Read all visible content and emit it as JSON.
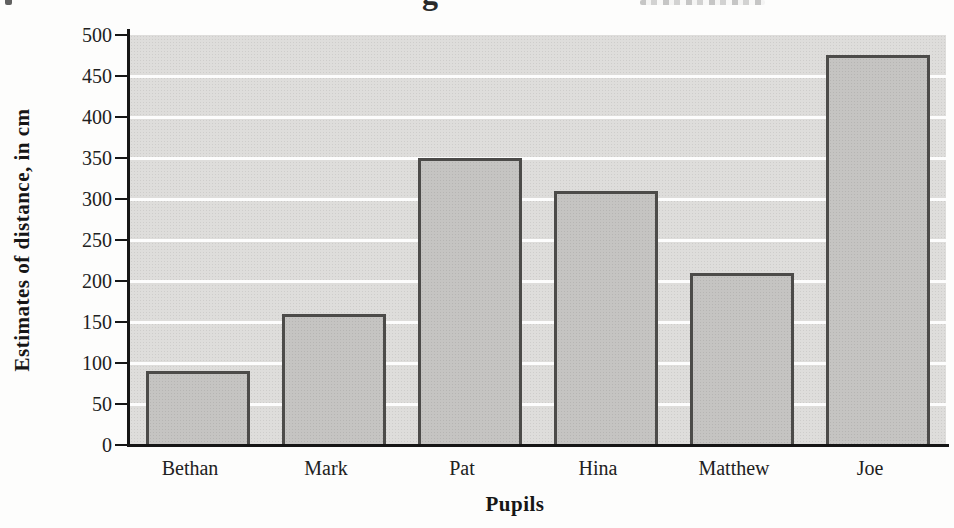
{
  "cropped_title": {
    "visible_descender": "g"
  },
  "chart_data": {
    "type": "bar",
    "title": "",
    "categories": [
      "Bethan",
      "Mark",
      "Pat",
      "Hina",
      "Matthew",
      "Joe"
    ],
    "values": [
      90,
      160,
      350,
      310,
      210,
      475
    ],
    "xlabel": "Pupils",
    "ylabel": "Estimates of distance, in cm",
    "ylim": [
      0,
      500
    ],
    "yticks": [
      0,
      50,
      100,
      150,
      200,
      250,
      300,
      350,
      400,
      450,
      500
    ],
    "grid": "horizontal white gridlines every 50",
    "legend": "none",
    "bar_width_px": 104
  },
  "colors": {
    "plot_background": "#dedddb",
    "bar_fill": "#c5c4c2",
    "bar_border": "#4c4b49",
    "gridline": "#ffffff",
    "axis": "#161616",
    "text": "#212121",
    "page_background": "#fdfdfc"
  }
}
